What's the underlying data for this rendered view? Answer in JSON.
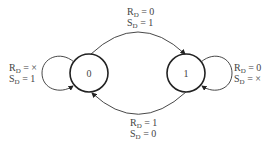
{
  "diagram": {
    "type": "state-transition-diagram",
    "states": [
      {
        "id": "s0",
        "label": "0",
        "cx": 89,
        "cy": 73,
        "r": 19
      },
      {
        "id": "s1",
        "label": "1",
        "cx": 186,
        "cy": 73,
        "r": 19
      }
    ],
    "transitions": [
      {
        "from": "0",
        "to": "1",
        "position": "top",
        "line1_var": "R",
        "line1_sub": "D",
        "line1_val": "= 0",
        "line2_var": "S",
        "line2_sub": "D",
        "line2_val": "= 1"
      },
      {
        "from": "1",
        "to": "0",
        "position": "bottom",
        "line1_var": "R",
        "line1_sub": "D",
        "line1_val": "= 1",
        "line2_var": "S",
        "line2_sub": "D",
        "line2_val": "= 0"
      },
      {
        "from": "0",
        "to": "0",
        "position": "left-self-loop",
        "line1_var": "R",
        "line1_sub": "D",
        "line1_val": "= ×",
        "line2_var": "S",
        "line2_sub": "D",
        "line2_val": "= 1"
      },
      {
        "from": "1",
        "to": "1",
        "position": "right-self-loop",
        "line1_var": "R",
        "line1_sub": "D",
        "line1_val": "= 0",
        "line2_var": "S",
        "line2_sub": "D",
        "line2_val": "= ×"
      }
    ],
    "colors": {
      "stroke": "#333333",
      "background": "#ffffff"
    }
  }
}
